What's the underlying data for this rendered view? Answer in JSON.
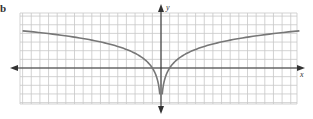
{
  "figure": {
    "label": "b.",
    "x_axis_label": "x",
    "y_axis_label": "y"
  },
  "colors": {
    "grid": "#c8c8c8",
    "axis": "#333333",
    "curve": "#777777",
    "background": "#ffffff"
  },
  "geometry": {
    "grid_left": 20,
    "grid_right": 297,
    "grid_top": 13,
    "grid_bottom": 104,
    "origin_x": 161,
    "origin_y": 68,
    "cell": 8.65,
    "x_axis_from": 10,
    "x_axis_to": 305,
    "y_axis_from": 4,
    "y_axis_to": 114
  },
  "chart_data": {
    "type": "line",
    "title": "",
    "xlabel": "x",
    "ylabel": "y",
    "grid": true,
    "xlim": [
      -16,
      16
    ],
    "ylim": [
      -4.2,
      6.3
    ],
    "function": "y = a*ln|x| (symmetric about y-axis, vertical asymptote at x = 0)",
    "asymptote": {
      "type": "vertical",
      "x": 0
    },
    "x_intercepts": [
      -1,
      1
    ],
    "series": [
      {
        "name": "curve",
        "x": [
          -16,
          -12,
          -8,
          -6,
          -4,
          -3,
          -2,
          -1.5,
          -1,
          -0.7,
          -0.5,
          -0.3,
          -0.2,
          0.2,
          0.3,
          0.5,
          0.7,
          1,
          1.5,
          2,
          3,
          4,
          6,
          8,
          12,
          16
        ],
        "y": [
          4.3,
          3.85,
          3.2,
          2.8,
          2.15,
          1.7,
          1.1,
          0.6,
          0,
          -0.55,
          -1.05,
          -1.85,
          -2.5,
          -2.5,
          -1.85,
          -1.05,
          -0.55,
          0,
          0.6,
          1.1,
          1.7,
          2.15,
          2.8,
          3.2,
          3.85,
          4.3
        ]
      }
    ]
  }
}
